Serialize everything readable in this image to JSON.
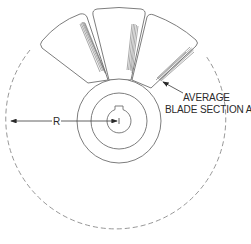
{
  "figure": {
    "type": "technical-illustration",
    "labels": {
      "radius": "R",
      "blade_section_line1": "AVERAGE",
      "blade_section_line2": "BLADE SECTION A",
      "hub_label": "B"
    },
    "colors": {
      "line": "#6e6e6e",
      "dashed": "#8a8a8a",
      "text": "#2a2a2a",
      "background": "#ffffff"
    }
  }
}
